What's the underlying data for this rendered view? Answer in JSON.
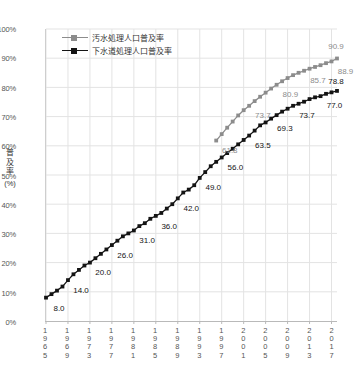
{
  "legend": {
    "position": "top-left-inside",
    "entries": [
      {
        "label": "汚水処理人口普及率",
        "color": "#8c8c8c",
        "marker": "square"
      },
      {
        "label": "下水道処理人口普及率",
        "color": "#141414",
        "marker": "square"
      }
    ]
  },
  "axes": {
    "y_title": "普及率",
    "y_unit": "(%)",
    "y_ticks": [
      "0%",
      "10%",
      "20%",
      "30%",
      "40%",
      "50%",
      "60%",
      "70%",
      "80%",
      "90%",
      "100%"
    ],
    "x_ticks": [
      "1965",
      "1969",
      "1973",
      "1977",
      "1981",
      "1985",
      "1989",
      "1993",
      "1997",
      "2001",
      "2005",
      "2009",
      "2013",
      "2017"
    ]
  },
  "chart_data": {
    "type": "line",
    "title": "",
    "subtitle": "",
    "xlabel": "",
    "ylabel": "普及率(%)",
    "ylim": [
      0,
      100
    ],
    "xlim": [
      1965,
      2018
    ],
    "grid": true,
    "legend_position": "top-left",
    "x": [
      1965,
      1966,
      1967,
      1968,
      1969,
      1970,
      1971,
      1972,
      1973,
      1974,
      1975,
      1976,
      1977,
      1978,
      1979,
      1980,
      1981,
      1982,
      1983,
      1984,
      1985,
      1986,
      1987,
      1988,
      1989,
      1990,
      1991,
      1992,
      1993,
      1994,
      1995,
      1996,
      1997,
      1998,
      1999,
      2000,
      2001,
      2002,
      2003,
      2004,
      2005,
      2006,
      2007,
      2008,
      2009,
      2010,
      2011,
      2012,
      2013,
      2014,
      2015,
      2016,
      2017,
      2018
    ],
    "series": [
      {
        "name": "汚水処理人口普及率",
        "color": "#8c8c8c",
        "x": [
          1996,
          1997,
          1998,
          1999,
          2000,
          2001,
          2002,
          2003,
          2004,
          2005,
          2006,
          2007,
          2008,
          2009,
          2010,
          2011,
          2012,
          2013,
          2014,
          2015,
          2016,
          2017,
          2018
        ],
        "values": [
          61.8,
          64.0,
          66.2,
          68.3,
          70.4,
          72.2,
          73.7,
          75.3,
          76.8,
          78.2,
          79.6,
          80.9,
          82.1,
          83.2,
          84.2,
          85.0,
          85.7,
          86.4,
          87.0,
          87.6,
          88.3,
          88.9,
          89.9
        ],
        "labeled_points": [
          {
            "x": 1996,
            "value": 61.8
          },
          {
            "x": 2002,
            "value": 73.7
          },
          {
            "x": 2007,
            "value": 80.9
          },
          {
            "x": 2012,
            "value": 85.7
          },
          {
            "x": 2017,
            "value": 88.9
          },
          {
            "x": 2018,
            "value": 90.9
          }
        ]
      },
      {
        "name": "下水道処理人口普及率",
        "color": "#141414",
        "x": [
          1965,
          1966,
          1967,
          1968,
          1969,
          1970,
          1971,
          1972,
          1973,
          1974,
          1975,
          1976,
          1977,
          1978,
          1979,
          1980,
          1981,
          1982,
          1983,
          1984,
          1985,
          1986,
          1987,
          1988,
          1989,
          1990,
          1991,
          1992,
          1993,
          1994,
          1995,
          1996,
          1997,
          1998,
          1999,
          2000,
          2001,
          2002,
          2003,
          2004,
          2005,
          2006,
          2007,
          2008,
          2009,
          2010,
          2011,
          2012,
          2013,
          2014,
          2015,
          2016,
          2017,
          2018
        ],
        "values": [
          8.0,
          9.2,
          10.4,
          11.8,
          14.0,
          16.0,
          17.5,
          19.0,
          20.0,
          21.5,
          23.0,
          24.5,
          26.0,
          27.5,
          29.0,
          30.0,
          31.0,
          32.5,
          33.5,
          35.0,
          36.0,
          37.0,
          38.5,
          40.0,
          42.0,
          44.0,
          45.0,
          46.5,
          49.0,
          51.0,
          53.0,
          54.5,
          56.0,
          57.5,
          59.0,
          60.5,
          62.0,
          63.5,
          65.2,
          67.0,
          68.0,
          69.3,
          70.5,
          71.7,
          72.7,
          73.7,
          74.4,
          75.1,
          76.0,
          76.6,
          77.0,
          77.8,
          78.3,
          78.8
        ],
        "labeled_points": [
          {
            "x": 1965,
            "value": 8.0
          },
          {
            "x": 1969,
            "value": 14.0
          },
          {
            "x": 1973,
            "value": 20.0
          },
          {
            "x": 1977,
            "value": 26.0
          },
          {
            "x": 1981,
            "value": 31.0
          },
          {
            "x": 1985,
            "value": 36.0
          },
          {
            "x": 1989,
            "value": 42.0
          },
          {
            "x": 1993,
            "value": 49.0
          },
          {
            "x": 1997,
            "value": 56.0
          },
          {
            "x": 2002,
            "value": 63.5
          },
          {
            "x": 2006,
            "value": 69.3
          },
          {
            "x": 2010,
            "value": 73.7
          },
          {
            "x": 2015,
            "value": 77.0
          },
          {
            "x": 2018,
            "value": 78.8
          }
        ]
      }
    ]
  },
  "colors": {
    "grid": "#e3e3e3",
    "axis": "#b9b9b9",
    "text": "#444444",
    "series_gray": "#8c8c8c",
    "series_black": "#141414",
    "background": "#ffffff"
  }
}
